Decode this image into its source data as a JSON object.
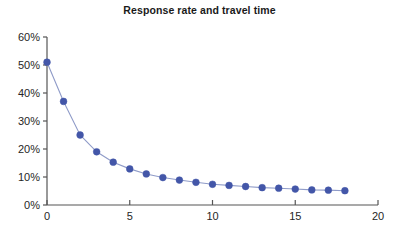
{
  "chart_data": {
    "type": "line",
    "title": "Response rate and travel time",
    "xlabel": "",
    "ylabel": "",
    "xlim": [
      0,
      20
    ],
    "ylim": [
      0,
      60
    ],
    "grid": false,
    "legend": "none",
    "markers": true,
    "marker_shape": "circle",
    "series_color": "#4356a8",
    "line_color": "#8f9bc8",
    "x_tick_labels": [
      "0",
      "5",
      "10",
      "15",
      "20"
    ],
    "x_ticks": [
      0,
      5,
      10,
      15,
      20
    ],
    "y_tick_labels": [
      "0%",
      "10%",
      "20%",
      "30%",
      "40%",
      "50%",
      "60%"
    ],
    "y_ticks": [
      0,
      10,
      20,
      30,
      40,
      50,
      60
    ],
    "x": [
      0,
      1,
      2,
      3,
      4,
      5,
      6,
      7,
      8,
      9,
      10,
      11,
      12,
      13,
      14,
      15,
      16,
      17,
      18
    ],
    "values": [
      51,
      37,
      25,
      19,
      15.3,
      12.9,
      11.1,
      9.8,
      8.9,
      8.1,
      7.4,
      7.0,
      6.6,
      6.2,
      6.0,
      5.7,
      5.4,
      5.3,
      5.1
    ],
    "series": [
      {
        "name": "Response rate",
        "values": [
          51,
          37,
          25,
          19,
          15.3,
          12.9,
          11.1,
          9.8,
          8.9,
          8.1,
          7.4,
          7.0,
          6.6,
          6.2,
          6.0,
          5.7,
          5.4,
          5.3,
          5.1
        ]
      }
    ]
  },
  "axes": {
    "axis_color": "#555555",
    "title_color": "#1a1a1a"
  }
}
